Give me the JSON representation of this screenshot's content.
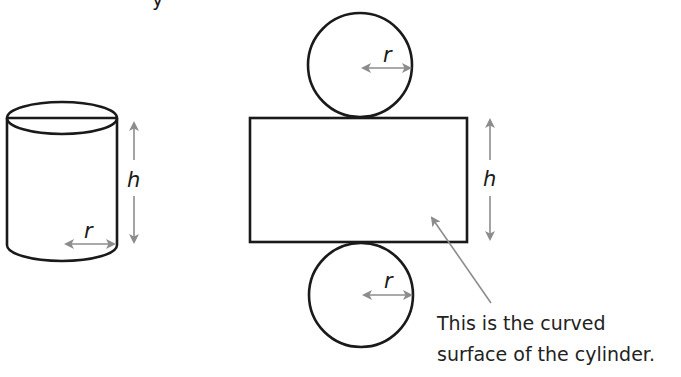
{
  "diagram": {
    "title_fragment": "y",
    "cylinder": {
      "height_label": "h",
      "radius_label": "r"
    },
    "net": {
      "top_circle": {
        "radius_label": "r"
      },
      "rectangle": {
        "height_label": "h"
      },
      "bottom_circle": {
        "radius_label": "r"
      }
    },
    "annotation": {
      "line1": "This is the curved",
      "line2": "surface of the cylinder."
    },
    "colors": {
      "outline": "#1a1a1a",
      "arrow": "#8c8c8c",
      "background": "#ffffff"
    }
  }
}
